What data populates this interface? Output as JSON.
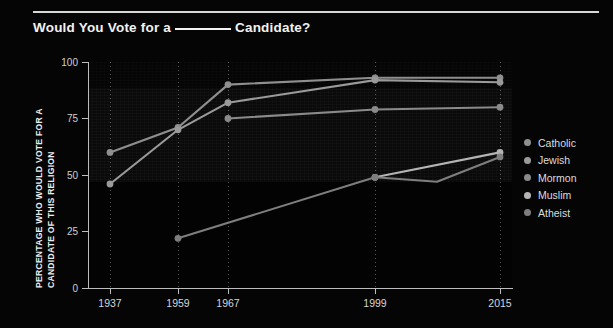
{
  "title": {
    "before": "Would You Vote for a",
    "blank": "______",
    "after": "Candidate?"
  },
  "axis": {
    "y_title_line1": "PERCENTAGE WHO WOULD VOTE FOR A",
    "y_title_line2": "CANDIDATE OF THIS RELIGION",
    "y_ticks": [
      "0",
      "25",
      "50",
      "75",
      "100"
    ],
    "x_ticks": [
      "1937",
      "1959",
      "1967",
      "1999",
      "2015"
    ]
  },
  "legend": {
    "items": [
      {
        "label": "Catholic",
        "color": "#8f8f8f"
      },
      {
        "label": "Jewish",
        "color": "#9a9a9a"
      },
      {
        "label": "Mormon",
        "color": "#8a8a8a"
      },
      {
        "label": "Muslim",
        "color": "#b4b4b4"
      },
      {
        "label": "Atheist",
        "color": "#7e7e7e"
      }
    ]
  },
  "chart_data": {
    "type": "line",
    "xlabel": "",
    "ylabel": "PERCENTAGE WHO WOULD VOTE FOR A CANDIDATE OF THIS RELIGION",
    "x": [
      1937,
      1959,
      1967,
      1999,
      2015
    ],
    "xlim": [
      1937,
      2015
    ],
    "ylim": [
      0,
      100
    ],
    "ytick_values": [
      0,
      25,
      50,
      75,
      100
    ],
    "grid": "vertical-dotted",
    "legend_position": "right",
    "series": [
      {
        "name": "Catholic",
        "color": "#8f8f8f",
        "x": [
          1937,
          1959,
          1967,
          1999,
          2015
        ],
        "values": [
          60,
          71,
          90,
          93,
          93
        ]
      },
      {
        "name": "Jewish",
        "color": "#9a9a9a",
        "x": [
          1937,
          1959,
          1967,
          1999,
          2015
        ],
        "values": [
          46,
          70,
          82,
          92,
          91
        ]
      },
      {
        "name": "Mormon",
        "color": "#8a8a8a",
        "x": [
          1967,
          1999,
          2015
        ],
        "values": [
          75,
          79,
          80
        ]
      },
      {
        "name": "Muslim",
        "color": "#b4b4b4",
        "x": [
          1999,
          2015
        ],
        "values": [
          49,
          60
        ]
      },
      {
        "name": "Atheist",
        "color": "#7e7e7e",
        "x": [
          1959,
          1999,
          2007,
          2015
        ],
        "values": [
          22,
          49,
          47,
          58
        ]
      }
    ]
  }
}
